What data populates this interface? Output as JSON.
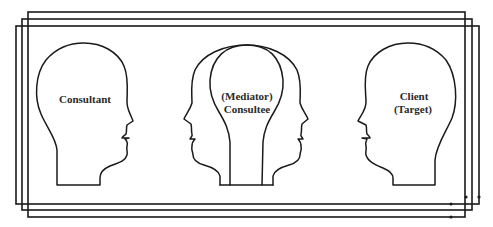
{
  "diagram": {
    "type": "consultation-triad",
    "colors": {
      "background": "#ffffff",
      "line": "#1a1a1a",
      "text": "#2a2a2a"
    },
    "frames": [
      {
        "id": "frame-back",
        "x": 16,
        "y": 26,
        "width": 463,
        "height": 178
      },
      {
        "id": "frame-middle",
        "x": 22,
        "y": 19,
        "width": 450,
        "height": 191
      },
      {
        "id": "frame-front",
        "x": 28,
        "y": 12,
        "width": 437,
        "height": 205
      }
    ],
    "heads": [
      {
        "id": "consultant",
        "facing": "right",
        "label_lines": [
          "Consultant"
        ]
      },
      {
        "id": "consultee",
        "facing": "both",
        "label_lines": [
          "(Mediator)",
          "Consultee"
        ]
      },
      {
        "id": "client",
        "facing": "left",
        "label_lines": [
          "Client",
          "(Target)"
        ]
      }
    ]
  }
}
